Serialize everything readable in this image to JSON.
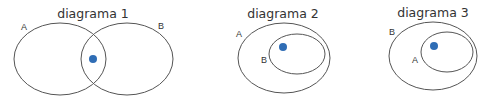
{
  "colors": {
    "stroke": "#555555",
    "dot": "#2f6db5",
    "text": "#333333",
    "background": "#ffffff"
  },
  "diagrams": [
    {
      "title": "diagrama 1",
      "relationship": "A and B overlap; dot in intersection",
      "sets": [
        {
          "label": "A"
        },
        {
          "label": "B"
        }
      ],
      "element": "dot in A ∩ B"
    },
    {
      "title": "diagrama 2",
      "relationship": "B is a subset of A; dot in B",
      "sets": [
        {
          "label": "A"
        },
        {
          "label": "B"
        }
      ],
      "element": "dot in B (inside A)"
    },
    {
      "title": "diagrama 3",
      "relationship": "A is a subset of B; dot in A",
      "sets": [
        {
          "label": "B"
        },
        {
          "label": "A"
        }
      ],
      "element": "dot in A (inside B)"
    }
  ]
}
